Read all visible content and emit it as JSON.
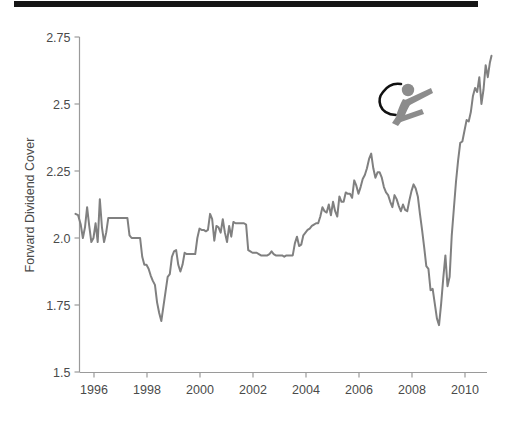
{
  "figure": {
    "top_rule_color": "#151515",
    "background": "#ffffff"
  },
  "chart_data": {
    "type": "line",
    "title": "",
    "subtitle": "",
    "xlabel": "",
    "ylabel": "Forward Dividend Cover",
    "xlim": [
      1995.25,
      2011.1
    ],
    "ylim": [
      1.5,
      2.78
    ],
    "grid": false,
    "legend": null,
    "line_color": "#808080",
    "line_width": 2.0,
    "axis_color": "#9a9a9a",
    "tick_label_color": "#4a4a4a",
    "xticks": [
      1996,
      1998,
      2000,
      2002,
      2004,
      2006,
      2008,
      2010
    ],
    "xticklabels": [
      "1996",
      "1998",
      "2000",
      "2002",
      "2004",
      "2006",
      "2008",
      "2010"
    ],
    "yticks": [
      1.5,
      1.75,
      2.0,
      2.25,
      2.5,
      2.75
    ],
    "yticklabels": [
      "1.5",
      "1.75",
      "2.0",
      "2.25",
      "2.5",
      "2.75"
    ],
    "series": [
      {
        "name": "Forward Dividend Cover",
        "x": [
          1995.3,
          1995.4,
          1995.5,
          1995.58,
          1995.66,
          1995.74,
          1995.82,
          1995.9,
          1995.98,
          1996.06,
          1996.14,
          1996.22,
          1996.3,
          1996.38,
          1996.46,
          1996.54,
          1996.62,
          1996.7,
          1996.78,
          1996.86,
          1996.94,
          1997.02,
          1997.1,
          1997.18,
          1997.26,
          1997.34,
          1997.42,
          1997.5,
          1997.58,
          1997.66,
          1997.74,
          1997.82,
          1997.9,
          1997.98,
          1998.06,
          1998.14,
          1998.22,
          1998.3,
          1998.38,
          1998.46,
          1998.54,
          1998.62,
          1998.7,
          1998.78,
          1998.86,
          1998.94,
          1999.02,
          1999.1,
          1999.18,
          1999.26,
          1999.34,
          1999.42,
          1999.5,
          1999.58,
          1999.66,
          1999.74,
          1999.82,
          1999.9,
          1999.98,
          2000.06,
          2000.14,
          2000.22,
          2000.3,
          2000.38,
          2000.46,
          2000.54,
          2000.62,
          2000.7,
          2000.78,
          2000.86,
          2000.94,
          2001.02,
          2001.1,
          2001.18,
          2001.26,
          2001.34,
          2001.42,
          2001.5,
          2001.58,
          2001.66,
          2001.74,
          2001.82,
          2001.9,
          2001.98,
          2002.06,
          2002.14,
          2002.22,
          2002.3,
          2002.38,
          2002.46,
          2002.54,
          2002.62,
          2002.7,
          2002.78,
          2002.86,
          2002.94,
          2003.02,
          2003.1,
          2003.18,
          2003.26,
          2003.34,
          2003.42,
          2003.5,
          2003.58,
          2003.66,
          2003.74,
          2003.82,
          2003.9,
          2003.98,
          2004.06,
          2004.14,
          2004.22,
          2004.3,
          2004.38,
          2004.46,
          2004.54,
          2004.62,
          2004.7,
          2004.78,
          2004.86,
          2004.94,
          2005.02,
          2005.1,
          2005.18,
          2005.26,
          2005.34,
          2005.42,
          2005.5,
          2005.58,
          2005.66,
          2005.74,
          2005.82,
          2005.9,
          2005.98,
          2006.06,
          2006.14,
          2006.22,
          2006.3,
          2006.38,
          2006.46,
          2006.54,
          2006.62,
          2006.7,
          2006.78,
          2006.86,
          2006.94,
          2007.02,
          2007.1,
          2007.18,
          2007.26,
          2007.34,
          2007.42,
          2007.5,
          2007.58,
          2007.66,
          2007.74,
          2007.82,
          2007.9,
          2007.98,
          2008.06,
          2008.14,
          2008.22,
          2008.3,
          2008.38,
          2008.46,
          2008.54,
          2008.62,
          2008.7,
          2008.78,
          2008.86,
          2008.94,
          2009.02,
          2009.1,
          2009.18,
          2009.26,
          2009.34,
          2009.42,
          2009.5,
          2009.58,
          2009.66,
          2009.74,
          2009.82,
          2009.9,
          2009.98,
          2010.06,
          2010.14,
          2010.22,
          2010.3,
          2010.38,
          2010.46,
          2010.54,
          2010.62,
          2010.7,
          2010.78,
          2010.86,
          2010.94,
          2011.0
        ],
        "y": [
          2.09,
          2.085,
          2.05,
          2.0,
          2.04,
          2.115,
          2.045,
          1.985,
          2.0,
          2.055,
          1.985,
          2.145,
          2.04,
          1.985,
          2.02,
          2.075,
          2.075,
          2.075,
          2.075,
          2.075,
          2.075,
          2.075,
          2.075,
          2.075,
          2.075,
          2.01,
          2.0,
          2.0,
          2.0,
          2.0,
          2.0,
          1.93,
          1.9,
          1.9,
          1.885,
          1.86,
          1.84,
          1.825,
          1.76,
          1.72,
          1.69,
          1.745,
          1.8,
          1.855,
          1.865,
          1.93,
          1.95,
          1.955,
          1.9,
          1.875,
          1.9,
          1.945,
          1.94,
          1.94,
          1.94,
          1.94,
          1.94,
          2.0,
          2.035,
          2.03,
          2.03,
          2.025,
          2.03,
          2.09,
          2.07,
          1.99,
          2.045,
          2.04,
          2.02,
          2.07,
          2.02,
          1.985,
          2.045,
          2.005,
          2.06,
          2.055,
          2.055,
          2.055,
          2.055,
          2.055,
          2.05,
          1.955,
          1.95,
          1.945,
          1.945,
          1.945,
          1.94,
          1.935,
          1.935,
          1.935,
          1.935,
          1.94,
          1.95,
          1.94,
          1.935,
          1.935,
          1.935,
          1.935,
          1.93,
          1.935,
          1.935,
          1.935,
          1.935,
          1.98,
          2.005,
          1.97,
          1.975,
          2.01,
          2.02,
          2.03,
          2.035,
          2.045,
          2.05,
          2.055,
          2.055,
          2.08,
          2.115,
          2.1,
          2.095,
          2.125,
          2.085,
          2.135,
          2.1,
          2.08,
          2.155,
          2.135,
          2.135,
          2.17,
          2.165,
          2.165,
          2.15,
          2.215,
          2.195,
          2.165,
          2.19,
          2.22,
          2.235,
          2.26,
          2.295,
          2.315,
          2.26,
          2.225,
          2.245,
          2.245,
          2.225,
          2.19,
          2.17,
          2.16,
          2.135,
          2.115,
          2.16,
          2.145,
          2.12,
          2.1,
          2.125,
          2.105,
          2.1,
          2.14,
          2.175,
          2.2,
          2.185,
          2.155,
          2.09,
          2.03,
          1.965,
          1.895,
          1.885,
          1.805,
          1.81,
          1.755,
          1.7,
          1.675,
          1.755,
          1.85,
          1.935,
          1.82,
          1.855,
          2.01,
          2.11,
          2.21,
          2.29,
          2.355,
          2.36,
          2.4,
          2.44,
          2.435,
          2.47,
          2.53,
          2.56,
          2.545,
          2.6,
          2.5,
          2.555,
          2.645,
          2.6,
          2.655,
          2.68
        ]
      }
    ]
  },
  "annotation_icon": {
    "name": "athlete-skier-figure",
    "color": "#8c8c8c",
    "accent_color": "#111111"
  }
}
